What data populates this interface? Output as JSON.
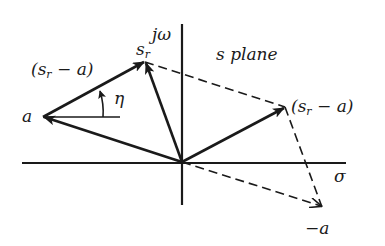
{
  "diagram": {
    "title_label": "s plane",
    "axes": {
      "vertical_label": "jω",
      "horizontal_label": "σ"
    },
    "points": {
      "origin": {
        "x": 182,
        "y": 162
      },
      "a": {
        "label": "a",
        "x": 43,
        "y": 117
      },
      "s_r": {
        "label": "s",
        "subscript": "r",
        "x": 145,
        "y": 62
      },
      "s_r_minus_a_right": {
        "label": "(s",
        "subscript": "r",
        "suffix": " − a)",
        "x": 285,
        "y": 107
      },
      "neg_a": {
        "label": "−a",
        "x": 322,
        "y": 207
      }
    },
    "labels": {
      "s_r_minus_a_left": {
        "prefix": "(s",
        "subscript": "r",
        "suffix": " − a)"
      },
      "angle": "η"
    },
    "colors": {
      "ink": "#1a1a1a",
      "background": "#ffffff"
    }
  }
}
